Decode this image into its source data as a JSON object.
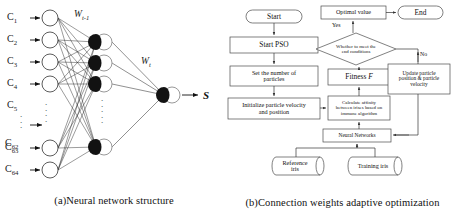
{
  "figure": {
    "panel_a": {
      "caption": "(a)Neural network structure",
      "input_labels": [
        "C1",
        "C2",
        "C3",
        "C4",
        "C5",
        "C62",
        "C63",
        "C64"
      ],
      "input_label_parts": [
        {
          "base": "C",
          "sub": "1"
        },
        {
          "base": "C",
          "sub": "2"
        },
        {
          "base": "C",
          "sub": "3"
        },
        {
          "base": "C",
          "sub": "4"
        },
        {
          "base": "C",
          "sub": "5"
        },
        {
          "base": "C",
          "sub": "62"
        },
        {
          "base": "C",
          "sub": "63"
        },
        {
          "base": "C",
          "sub": "64"
        }
      ],
      "weight_label_1": {
        "base": "W",
        "sub": "t-1"
      },
      "weight_label_2": {
        "base": "W",
        "sub": "t"
      },
      "output_label": "S",
      "layers": {
        "input_nodes_drawn": 6,
        "hidden_nodes_drawn": 5,
        "output_nodes": 1
      },
      "colors": {
        "node_stroke": "#3a3a3a",
        "edge": "#222222",
        "arrowhead": "#111111"
      }
    },
    "panel_b": {
      "caption": "(b)Connection weights adaptive optimization",
      "nodes": {
        "start": "Start",
        "start_pso": "Start PSO",
        "set_particles": "Set the number of\nparticles",
        "init_particles": "Initialize particle velocity\nand position",
        "calc_affinity": "Calculate affinity\nbetween irises based on\nimmune algorithm",
        "fitness": "Fitness",
        "fitness_var": "F",
        "decision": "Whether to meet the\nend conditions",
        "optimal_value": "Optimal value",
        "end": "End",
        "update_particle": "Update particle\nposition & particle\nvelocity",
        "neural_networks": "Neural Networks",
        "reference_iris": "Reference\niris",
        "training_iris": "Training iris"
      },
      "edge_labels": {
        "yes": "Yes",
        "no": "No"
      },
      "colors": {
        "box_stroke": "#4a4a4a",
        "line": "#333333",
        "text": "#111111"
      }
    }
  }
}
